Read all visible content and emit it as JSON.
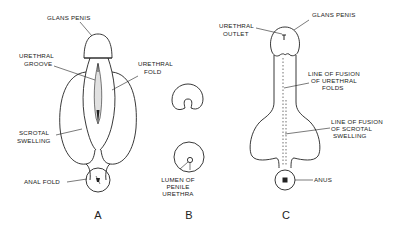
{
  "figure": {
    "panels": [
      {
        "id": "A",
        "label": "A",
        "annotations": {
          "glans_penis": "GLANS PENIS",
          "urethral_groove_1": "URETHRAL",
          "urethral_groove_2": "GROOVE",
          "urethral_fold_1": "URETHRAL",
          "urethral_fold_2": "FOLD",
          "scrotal_swelling_1": "SCROTAL",
          "scrotal_swelling_2": "SWELLING",
          "anal_fold": "ANAL FOLD"
        }
      },
      {
        "id": "B",
        "label": "B",
        "annotations": {
          "lumen_1": "LUMEN OF",
          "lumen_2": "PENILE",
          "lumen_3": "URETHRA"
        }
      },
      {
        "id": "C",
        "label": "C",
        "annotations": {
          "glans_penis": "GLANS PENIS",
          "urethral_outlet_1": "URETHRAL",
          "urethral_outlet_2": "OUTLET",
          "fusion_folds_1": "LINE OF FUSION",
          "fusion_folds_2": "OF URETHRAL",
          "fusion_folds_3": "FOLDS",
          "fusion_scrotal_1": "LINE OF FUSION",
          "fusion_scrotal_2": "OF SCROTAL",
          "fusion_scrotal_3": "SWELLING",
          "anus": "ANUS"
        }
      }
    ]
  }
}
